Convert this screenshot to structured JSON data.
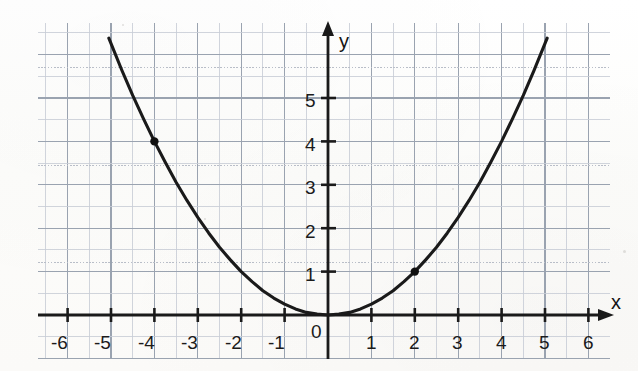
{
  "figure": {
    "background_color": "#fdfdfc",
    "grid_minor_color": "#c8cdd6",
    "grid_major_color": "#9aa3b0",
    "grid_dotted_color": "#b9bec8",
    "axis_color": "#1a1a1a",
    "curve_color": "#1a1a1a",
    "point_color": "#101010",
    "label_color": "#1b1b1b"
  },
  "axes": {
    "x_axis_label": "x",
    "y_axis_label": "y",
    "origin_label": "0",
    "x_tick_labels": [
      "-6",
      "-5",
      "-4",
      "-3",
      "-2",
      "-1",
      "1",
      "2",
      "3",
      "4",
      "5",
      "6"
    ],
    "y_tick_labels": [
      "1",
      "2",
      "3",
      "4",
      "5"
    ]
  },
  "chart_data": {
    "type": "line",
    "title": "",
    "subtitle": "",
    "xlabel": "x",
    "ylabel": "y",
    "xlim": [
      -6.7,
      6.6
    ],
    "ylim": [
      -0.95,
      6.65
    ],
    "x_ticks": [
      -6,
      -5,
      -4,
      -3,
      -2,
      -1,
      0,
      1,
      2,
      3,
      4,
      5,
      6
    ],
    "y_ticks": [
      0,
      1,
      2,
      3,
      4,
      5
    ],
    "grid": true,
    "grid_minor_step": 0.5,
    "legend": null,
    "series": [
      {
        "name": "y = x^2 / 4",
        "equation": "y = x^2/4",
        "type": "line",
        "x_domain": [
          -5.05,
          5.05
        ],
        "x": [
          -5.05,
          -4.75,
          -4.5,
          -4.25,
          -4,
          -3.75,
          -3.5,
          -3.25,
          -3,
          -2.75,
          -2.5,
          -2.25,
          -2,
          -1.75,
          -1.5,
          -1.25,
          -1,
          -0.75,
          -0.5,
          -0.25,
          0,
          0.25,
          0.5,
          0.75,
          1,
          1.25,
          1.5,
          1.75,
          2,
          2.25,
          2.5,
          2.75,
          3,
          3.25,
          3.5,
          3.75,
          4,
          4.25,
          4.5,
          4.75,
          5.05
        ],
        "y": [
          6.38,
          5.64,
          5.06,
          4.52,
          4,
          3.52,
          3.06,
          2.64,
          2.25,
          1.89,
          1.56,
          1.27,
          1,
          0.77,
          0.56,
          0.39,
          0.25,
          0.14,
          0.06,
          0.02,
          0,
          0.02,
          0.06,
          0.14,
          0.25,
          0.39,
          0.56,
          0.77,
          1,
          1.27,
          1.56,
          1.89,
          2.25,
          2.64,
          3.06,
          3.52,
          4,
          4.52,
          5.06,
          5.64,
          6.38
        ]
      }
    ],
    "annotations": [
      {
        "name": "marked-point-left",
        "x": -4,
        "y": 4,
        "label": ""
      },
      {
        "name": "marked-point-right",
        "x": 2,
        "y": 1,
        "label": ""
      }
    ]
  }
}
